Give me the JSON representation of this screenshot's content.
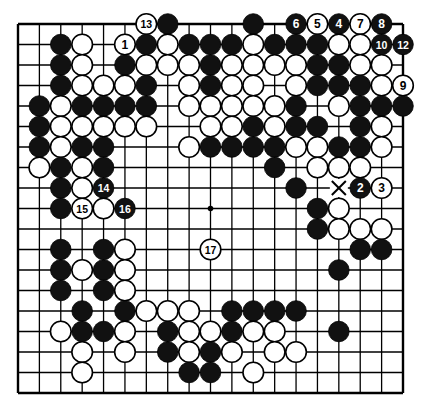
{
  "diagram": {
    "type": "go-board",
    "size": 19,
    "colors": {
      "background": "#ffffff",
      "line": "#000000",
      "black_stone": "#111111",
      "white_stone": "#ffffff",
      "black_label": "#ffffff",
      "white_label": "#000000"
    },
    "star_points": [
      [
        9,
        9
      ]
    ],
    "markers": [
      {
        "type": "cross",
        "col": 15,
        "row": 8
      }
    ],
    "stones": [
      {
        "c": "W",
        "col": 6,
        "row": 0,
        "label": "13"
      },
      {
        "c": "B",
        "col": 7,
        "row": 0
      },
      {
        "c": "B",
        "col": 11,
        "row": 0
      },
      {
        "c": "B",
        "col": 13,
        "row": 0,
        "label": "6"
      },
      {
        "c": "W",
        "col": 14,
        "row": 0,
        "label": "5"
      },
      {
        "c": "B",
        "col": 15,
        "row": 0,
        "label": "4"
      },
      {
        "c": "W",
        "col": 16,
        "row": 0,
        "label": "7"
      },
      {
        "c": "B",
        "col": 17,
        "row": 0,
        "label": "8"
      },
      {
        "c": "B",
        "col": 2,
        "row": 1
      },
      {
        "c": "W",
        "col": 3,
        "row": 1
      },
      {
        "c": "W",
        "col": 5,
        "row": 1,
        "label": "1"
      },
      {
        "c": "B",
        "col": 6,
        "row": 1
      },
      {
        "c": "W",
        "col": 7,
        "row": 1
      },
      {
        "c": "B",
        "col": 8,
        "row": 1
      },
      {
        "c": "B",
        "col": 9,
        "row": 1
      },
      {
        "c": "B",
        "col": 10,
        "row": 1
      },
      {
        "c": "W",
        "col": 11,
        "row": 1
      },
      {
        "c": "B",
        "col": 12,
        "row": 1
      },
      {
        "c": "B",
        "col": 13,
        "row": 1
      },
      {
        "c": "B",
        "col": 14,
        "row": 1
      },
      {
        "c": "W",
        "col": 15,
        "row": 1
      },
      {
        "c": "W",
        "col": 16,
        "row": 1
      },
      {
        "c": "B",
        "col": 17,
        "row": 1,
        "label": "10"
      },
      {
        "c": "B",
        "col": 18,
        "row": 1,
        "label": "12"
      },
      {
        "c": "B",
        "col": 2,
        "row": 2
      },
      {
        "c": "W",
        "col": 3,
        "row": 2
      },
      {
        "c": "B",
        "col": 5,
        "row": 2
      },
      {
        "c": "W",
        "col": 6,
        "row": 2
      },
      {
        "c": "W",
        "col": 7,
        "row": 2
      },
      {
        "c": "W",
        "col": 8,
        "row": 2
      },
      {
        "c": "B",
        "col": 9,
        "row": 2
      },
      {
        "c": "W",
        "col": 10,
        "row": 2
      },
      {
        "c": "W",
        "col": 11,
        "row": 2
      },
      {
        "c": "W",
        "col": 12,
        "row": 2
      },
      {
        "c": "W",
        "col": 13,
        "row": 2
      },
      {
        "c": "B",
        "col": 14,
        "row": 2
      },
      {
        "c": "B",
        "col": 15,
        "row": 2
      },
      {
        "c": "W",
        "col": 16,
        "row": 2
      },
      {
        "c": "W",
        "col": 17,
        "row": 2
      },
      {
        "c": "B",
        "col": 2,
        "row": 3
      },
      {
        "c": "W",
        "col": 3,
        "row": 3
      },
      {
        "c": "W",
        "col": 4,
        "row": 3
      },
      {
        "c": "W",
        "col": 5,
        "row": 3
      },
      {
        "c": "B",
        "col": 6,
        "row": 3
      },
      {
        "c": "W",
        "col": 8,
        "row": 3
      },
      {
        "c": "B",
        "col": 9,
        "row": 3
      },
      {
        "c": "W",
        "col": 10,
        "row": 3
      },
      {
        "c": "W",
        "col": 11,
        "row": 3
      },
      {
        "c": "W",
        "col": 13,
        "row": 3
      },
      {
        "c": "B",
        "col": 14,
        "row": 3
      },
      {
        "c": "B",
        "col": 15,
        "row": 3
      },
      {
        "c": "B",
        "col": 16,
        "row": 3
      },
      {
        "c": "W",
        "col": 17,
        "row": 3
      },
      {
        "c": "W",
        "col": 18,
        "row": 3,
        "label": "9"
      },
      {
        "c": "B",
        "col": 1,
        "row": 4
      },
      {
        "c": "W",
        "col": 2,
        "row": 4
      },
      {
        "c": "B",
        "col": 3,
        "row": 4
      },
      {
        "c": "B",
        "col": 4,
        "row": 4
      },
      {
        "c": "B",
        "col": 5,
        "row": 4
      },
      {
        "c": "B",
        "col": 6,
        "row": 4
      },
      {
        "c": "W",
        "col": 8,
        "row": 4
      },
      {
        "c": "W",
        "col": 9,
        "row": 4
      },
      {
        "c": "W",
        "col": 10,
        "row": 4
      },
      {
        "c": "W",
        "col": 11,
        "row": 4
      },
      {
        "c": "W",
        "col": 12,
        "row": 4
      },
      {
        "c": "B",
        "col": 13,
        "row": 4
      },
      {
        "c": "W",
        "col": 15,
        "row": 4
      },
      {
        "c": "B",
        "col": 16,
        "row": 4
      },
      {
        "c": "B",
        "col": 17,
        "row": 4
      },
      {
        "c": "B",
        "col": 18,
        "row": 4
      },
      {
        "c": "B",
        "col": 1,
        "row": 5
      },
      {
        "c": "W",
        "col": 2,
        "row": 5
      },
      {
        "c": "W",
        "col": 3,
        "row": 5
      },
      {
        "c": "W",
        "col": 4,
        "row": 5
      },
      {
        "c": "W",
        "col": 5,
        "row": 5
      },
      {
        "c": "W",
        "col": 6,
        "row": 5
      },
      {
        "c": "W",
        "col": 9,
        "row": 5
      },
      {
        "c": "W",
        "col": 10,
        "row": 5
      },
      {
        "c": "B",
        "col": 11,
        "row": 5
      },
      {
        "c": "W",
        "col": 12,
        "row": 5
      },
      {
        "c": "B",
        "col": 13,
        "row": 5
      },
      {
        "c": "B",
        "col": 14,
        "row": 5
      },
      {
        "c": "B",
        "col": 16,
        "row": 5
      },
      {
        "c": "W",
        "col": 17,
        "row": 5
      },
      {
        "c": "B",
        "col": 1,
        "row": 6
      },
      {
        "c": "W",
        "col": 2,
        "row": 6
      },
      {
        "c": "B",
        "col": 3,
        "row": 6
      },
      {
        "c": "B",
        "col": 4,
        "row": 6
      },
      {
        "c": "W",
        "col": 8,
        "row": 6
      },
      {
        "c": "B",
        "col": 9,
        "row": 6
      },
      {
        "c": "B",
        "col": 10,
        "row": 6
      },
      {
        "c": "B",
        "col": 11,
        "row": 6
      },
      {
        "c": "B",
        "col": 12,
        "row": 6
      },
      {
        "c": "W",
        "col": 13,
        "row": 6
      },
      {
        "c": "W",
        "col": 14,
        "row": 6
      },
      {
        "c": "B",
        "col": 15,
        "row": 6
      },
      {
        "c": "B",
        "col": 16,
        "row": 6
      },
      {
        "c": "W",
        "col": 17,
        "row": 6
      },
      {
        "c": "W",
        "col": 1,
        "row": 7
      },
      {
        "c": "B",
        "col": 2,
        "row": 7
      },
      {
        "c": "W",
        "col": 3,
        "row": 7
      },
      {
        "c": "B",
        "col": 4,
        "row": 7
      },
      {
        "c": "B",
        "col": 12,
        "row": 7
      },
      {
        "c": "W",
        "col": 14,
        "row": 7
      },
      {
        "c": "W",
        "col": 15,
        "row": 7
      },
      {
        "c": "W",
        "col": 16,
        "row": 7
      },
      {
        "c": "B",
        "col": 2,
        "row": 8
      },
      {
        "c": "W",
        "col": 3,
        "row": 8
      },
      {
        "c": "B",
        "col": 4,
        "row": 8,
        "label": "14"
      },
      {
        "c": "B",
        "col": 13,
        "row": 8
      },
      {
        "c": "B",
        "col": 16,
        "row": 8,
        "label": "2"
      },
      {
        "c": "W",
        "col": 17,
        "row": 8,
        "label": "3"
      },
      {
        "c": "B",
        "col": 2,
        "row": 9
      },
      {
        "c": "W",
        "col": 3,
        "row": 9,
        "label": "15"
      },
      {
        "c": "W",
        "col": 4,
        "row": 9
      },
      {
        "c": "B",
        "col": 5,
        "row": 9,
        "label": "16"
      },
      {
        "c": "B",
        "col": 14,
        "row": 9
      },
      {
        "c": "W",
        "col": 15,
        "row": 9
      },
      {
        "c": "B",
        "col": 14,
        "row": 10
      },
      {
        "c": "W",
        "col": 15,
        "row": 10
      },
      {
        "c": "W",
        "col": 16,
        "row": 10
      },
      {
        "c": "W",
        "col": 17,
        "row": 10
      },
      {
        "c": "B",
        "col": 2,
        "row": 11
      },
      {
        "c": "B",
        "col": 4,
        "row": 11
      },
      {
        "c": "W",
        "col": 5,
        "row": 11
      },
      {
        "c": "W",
        "col": 9,
        "row": 11,
        "label": "17"
      },
      {
        "c": "B",
        "col": 16,
        "row": 11
      },
      {
        "c": "B",
        "col": 17,
        "row": 11
      },
      {
        "c": "B",
        "col": 2,
        "row": 12
      },
      {
        "c": "W",
        "col": 3,
        "row": 12
      },
      {
        "c": "B",
        "col": 4,
        "row": 12
      },
      {
        "c": "W",
        "col": 5,
        "row": 12
      },
      {
        "c": "B",
        "col": 15,
        "row": 12
      },
      {
        "c": "B",
        "col": 2,
        "row": 13
      },
      {
        "c": "B",
        "col": 4,
        "row": 13
      },
      {
        "c": "W",
        "col": 5,
        "row": 13
      },
      {
        "c": "B",
        "col": 3,
        "row": 14
      },
      {
        "c": "B",
        "col": 5,
        "row": 14
      },
      {
        "c": "W",
        "col": 6,
        "row": 14
      },
      {
        "c": "W",
        "col": 7,
        "row": 14
      },
      {
        "c": "W",
        "col": 8,
        "row": 14
      },
      {
        "c": "B",
        "col": 10,
        "row": 14
      },
      {
        "c": "B",
        "col": 11,
        "row": 14
      },
      {
        "c": "B",
        "col": 12,
        "row": 14
      },
      {
        "c": "B",
        "col": 13,
        "row": 14
      },
      {
        "c": "W",
        "col": 2,
        "row": 15
      },
      {
        "c": "B",
        "col": 3,
        "row": 15
      },
      {
        "c": "B",
        "col": 4,
        "row": 15
      },
      {
        "c": "W",
        "col": 5,
        "row": 15
      },
      {
        "c": "B",
        "col": 7,
        "row": 15
      },
      {
        "c": "W",
        "col": 8,
        "row": 15
      },
      {
        "c": "W",
        "col": 9,
        "row": 15
      },
      {
        "c": "B",
        "col": 10,
        "row": 15
      },
      {
        "c": "W",
        "col": 11,
        "row": 15
      },
      {
        "c": "W",
        "col": 12,
        "row": 15
      },
      {
        "c": "B",
        "col": 15,
        "row": 15
      },
      {
        "c": "W",
        "col": 3,
        "row": 16
      },
      {
        "c": "W",
        "col": 5,
        "row": 16
      },
      {
        "c": "B",
        "col": 7,
        "row": 16
      },
      {
        "c": "W",
        "col": 8,
        "row": 16
      },
      {
        "c": "B",
        "col": 9,
        "row": 16
      },
      {
        "c": "W",
        "col": 10,
        "row": 16
      },
      {
        "c": "W",
        "col": 12,
        "row": 16
      },
      {
        "c": "W",
        "col": 13,
        "row": 16
      },
      {
        "c": "W",
        "col": 3,
        "row": 17
      },
      {
        "c": "B",
        "col": 8,
        "row": 17
      },
      {
        "c": "B",
        "col": 9,
        "row": 17
      },
      {
        "c": "W",
        "col": 11,
        "row": 17
      }
    ]
  }
}
